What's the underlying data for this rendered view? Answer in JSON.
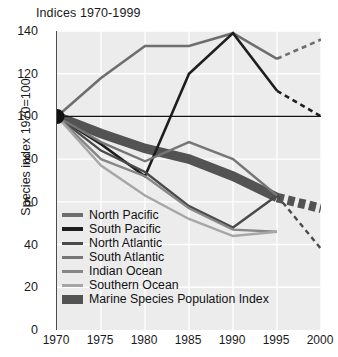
{
  "chart_data": {
    "type": "line",
    "title": "Indices 1970-1999",
    "xlabel": "",
    "ylabel": "Species index 1970=100",
    "x": [
      1970,
      1975,
      1980,
      1985,
      1990,
      1995,
      2000
    ],
    "xlim": [
      1970,
      2000
    ],
    "ylim": [
      0,
      140
    ],
    "yticks": [
      0,
      20,
      40,
      60,
      80,
      100,
      120,
      140
    ],
    "xticks": [
      1970,
      1975,
      1980,
      1985,
      1990,
      1995,
      2000
    ],
    "grid": true,
    "legend_position": "inside-lower-left",
    "reference_line": 100,
    "origin_marker": {
      "x": 1970,
      "y": 100,
      "label": "common origin dot"
    },
    "series": [
      {
        "name": "North Pacific",
        "color": "#6e6e6e",
        "width": 2.6,
        "values": [
          100,
          118,
          133,
          133,
          139,
          127,
          136
        ],
        "solid_through": 1995,
        "dashed_from": 1995
      },
      {
        "name": "South Pacific",
        "color": "#1e1e1e",
        "width": 2.6,
        "values": [
          100,
          87,
          72,
          120,
          139,
          112,
          100
        ],
        "solid_through": 1995,
        "dashed_from": 1995
      },
      {
        "name": "North Atlantic",
        "color": "#4a4a4a",
        "width": 2.4,
        "values": [
          100,
          84,
          74,
          58,
          48,
          63,
          38
        ],
        "solid_through": 1995,
        "dashed_from": 1995
      },
      {
        "name": "South Atlantic",
        "color": "#767676",
        "width": 2.4,
        "values": [
          100,
          88,
          79,
          88,
          80,
          63,
          null
        ],
        "solid_through": 1995,
        "dashed_from": null
      },
      {
        "name": "Indian Ocean",
        "color": "#878787",
        "width": 2.4,
        "values": [
          100,
          80,
          72,
          57,
          47,
          46,
          null
        ],
        "solid_through": 1995,
        "dashed_from": null
      },
      {
        "name": "Southern Ocean",
        "color": "#a6a6a6",
        "width": 2.4,
        "values": [
          100,
          77,
          63,
          52,
          44,
          46,
          null
        ],
        "solid_through": 1995,
        "dashed_from": null
      },
      {
        "name": "Marine Species Population Index",
        "color": "#535353",
        "width": 9.5,
        "values": [
          100,
          92,
          85,
          80,
          72,
          62,
          57
        ],
        "solid_through": 1995,
        "dashed_from": 1995
      }
    ]
  },
  "legend": {
    "items": [
      {
        "label": "North Pacific",
        "color": "#6e6e6e",
        "style": "line"
      },
      {
        "label": "South Pacific",
        "color": "#1e1e1e",
        "style": "line"
      },
      {
        "label": "North Atlantic",
        "color": "#4a4a4a",
        "style": "line"
      },
      {
        "label": "South Atlantic",
        "color": "#767676",
        "style": "line"
      },
      {
        "label": "Indian Ocean",
        "color": "#878787",
        "style": "line"
      },
      {
        "label": "Southern Ocean",
        "color": "#a6a6a6",
        "style": "line"
      },
      {
        "label": "Marine Species Population Index",
        "color": "#535353",
        "style": "block"
      }
    ]
  },
  "axes": {
    "y_title": "Species index 1970=100",
    "y_ticks": [
      "140",
      "120",
      "100",
      "80",
      "60",
      "40",
      "20",
      "0"
    ],
    "x_ticks": [
      "1970",
      "1975",
      "1980",
      "1985",
      "1990",
      "1995",
      "2000"
    ]
  },
  "colors": {
    "plot_background": "#ececec",
    "grid": "#ffffff",
    "axis": "#4d4d4d",
    "page_background": "#ffffff",
    "text": "#111111"
  }
}
